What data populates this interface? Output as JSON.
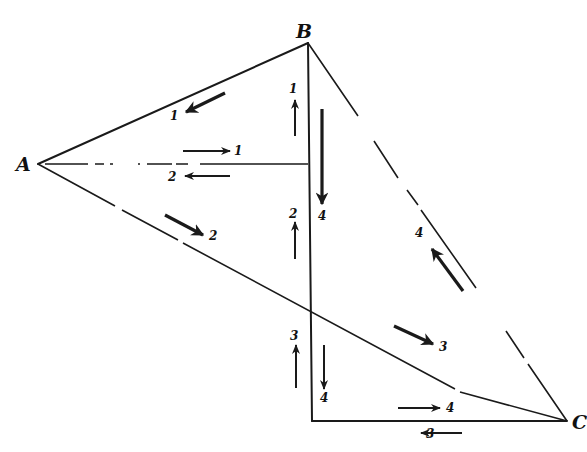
{
  "figure": {
    "type": "force-diagram / load path diagram",
    "vertices": [
      {
        "id": "A",
        "label": "A",
        "x": 38,
        "y": 164
      },
      {
        "id": "B",
        "label": "B",
        "x": 308,
        "y": 43
      },
      {
        "id": "C",
        "label": "C",
        "x": 567,
        "y": 421
      }
    ],
    "vertex_labels": {
      "A": "A",
      "B": "B",
      "C": "C"
    },
    "arrow_labels": {
      "ab_down": "1",
      "horizontal_right": "1",
      "horizontal_left": "2",
      "vertical_upper_up": "1",
      "vertical_upper_down": "4",
      "vertical_mid_up": "2",
      "ac_upper": "2",
      "bc_up": "4",
      "ac_lower": "3",
      "vertical_lower_up": "3",
      "vertical_lower_down": "4",
      "bottom_right": "4",
      "bottom_left": "3"
    },
    "lines": [
      {
        "name": "AB",
        "style": "solid"
      },
      {
        "name": "A-to-vertical",
        "style": "dash-dot"
      },
      {
        "name": "AC",
        "style": "partly dashed"
      },
      {
        "name": "BC",
        "style": "dashed with gaps"
      },
      {
        "name": "B-vertical",
        "style": "solid"
      },
      {
        "name": "bottom-horizontal",
        "style": "solid"
      }
    ],
    "colors": {
      "ink": "#1a1a1a",
      "background": "#ffffff"
    }
  }
}
